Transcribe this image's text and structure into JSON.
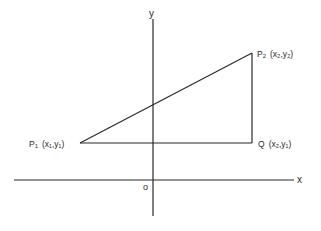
{
  "diagram": {
    "type": "coordinate-geometry",
    "axes": {
      "x_label": "x",
      "y_label": "y",
      "origin_label": "o"
    },
    "points": [
      {
        "id": "P1",
        "name": "P",
        "sub": "1",
        "coords": "(x₁,y₁)",
        "label": "P₁ (x₁,y₁)"
      },
      {
        "id": "P2",
        "name": "P",
        "sub": "2",
        "coords": "(x₂,y₂)",
        "label": "P₂ (x₂,y₂)"
      },
      {
        "id": "Q",
        "name": "Q",
        "sub": "",
        "coords": "(x₂,y₁)",
        "label": "Q (x₂,y₁)"
      }
    ],
    "segments": [
      {
        "from": "P1",
        "to": "P2"
      },
      {
        "from": "P1",
        "to": "Q"
      },
      {
        "from": "Q",
        "to": "P2"
      }
    ],
    "colors": {
      "line": "#2a2a2a",
      "background": "#ffffff"
    }
  }
}
